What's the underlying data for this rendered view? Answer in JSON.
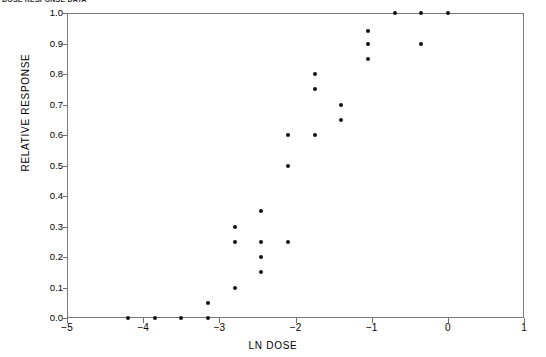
{
  "header": {
    "text": "DOSE RESPONSE DATA"
  },
  "chart_data": {
    "type": "scatter",
    "title": "",
    "xlabel": "LN DOSE",
    "ylabel": "RELATIVE RESPONSE",
    "xlim": [
      -5,
      1
    ],
    "ylim": [
      0.0,
      1.0
    ],
    "grid": false,
    "legend": null,
    "marker": "filled-circle",
    "marker_color": "#111111",
    "xticks": [
      -5,
      -4,
      -3,
      -2,
      -1,
      0,
      1
    ],
    "xticklabels": [
      "−5",
      "−4",
      "−3",
      "−2",
      "−1",
      "0",
      "1"
    ],
    "yticks": [
      0.0,
      0.1,
      0.2,
      0.3,
      0.4,
      0.5,
      0.6,
      0.7,
      0.8,
      0.9,
      1.0
    ],
    "yticklabels": [
      "0.0",
      "0.1",
      "0.2",
      "0.3",
      "0.4",
      "0.5",
      "0.6",
      "0.7",
      "0.8",
      "0.9",
      "1.0"
    ],
    "points": [
      {
        "x": -4.2,
        "y": 0.0
      },
      {
        "x": -3.85,
        "y": 0.0
      },
      {
        "x": -3.5,
        "y": 0.0
      },
      {
        "x": -3.15,
        "y": 0.0
      },
      {
        "x": -3.15,
        "y": 0.05
      },
      {
        "x": -2.8,
        "y": 0.1
      },
      {
        "x": -2.45,
        "y": 0.15
      },
      {
        "x": -2.8,
        "y": 0.25
      },
      {
        "x": -2.45,
        "y": 0.25
      },
      {
        "x": -2.1,
        "y": 0.25
      },
      {
        "x": -2.45,
        "y": 0.2
      },
      {
        "x": -2.8,
        "y": 0.3
      },
      {
        "x": -2.45,
        "y": 0.35
      },
      {
        "x": -2.1,
        "y": 0.5
      },
      {
        "x": -2.1,
        "y": 0.6
      },
      {
        "x": -1.75,
        "y": 0.6
      },
      {
        "x": -1.75,
        "y": 0.75
      },
      {
        "x": -1.75,
        "y": 0.8
      },
      {
        "x": -1.4,
        "y": 0.65
      },
      {
        "x": -1.4,
        "y": 0.7
      },
      {
        "x": -1.05,
        "y": 0.85
      },
      {
        "x": -1.05,
        "y": 0.9
      },
      {
        "x": -1.05,
        "y": 0.94
      },
      {
        "x": -0.7,
        "y": 1.0
      },
      {
        "x": -0.35,
        "y": 1.0
      },
      {
        "x": -0.35,
        "y": 0.9
      },
      {
        "x": 0.0,
        "y": 1.0
      }
    ]
  }
}
